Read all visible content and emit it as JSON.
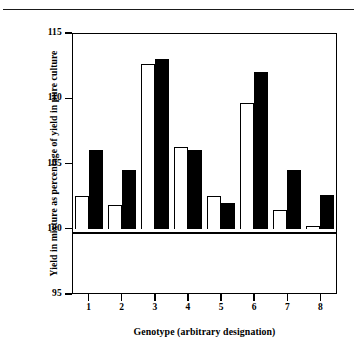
{
  "figure": {
    "has_top_rule": true,
    "background": "#ffffff",
    "ink_color": "#000000"
  },
  "chart_data": {
    "type": "bar",
    "title": "",
    "subtitle": "",
    "xlabel": "Genotype (arbitrary designation)",
    "ylabel": "Yield in mixture as percentage of yield in pure culture",
    "categories": [
      "1",
      "2",
      "3",
      "4",
      "5",
      "6",
      "7",
      "8"
    ],
    "xtick_labels": [
      "1",
      "2",
      "3",
      "4",
      "5",
      "6",
      "7",
      "8"
    ],
    "ytick_labels": [
      "95",
      "100",
      "105",
      "110",
      "115"
    ],
    "yticks": [
      95,
      100,
      105,
      110,
      115
    ],
    "ylim": [
      95,
      115
    ],
    "baseline": 100,
    "grid": false,
    "legend": null,
    "legend_position": "none",
    "series": [
      {
        "name": "open",
        "style": "open-bar",
        "fill": "#ffffff",
        "edge": "#000000",
        "values": [
          102.5,
          101.8,
          112.6,
          106.3,
          102.5,
          109.6,
          101.4,
          100.2
        ]
      },
      {
        "name": "filled",
        "style": "filled-bar",
        "fill": "#000000",
        "edge": "#000000",
        "values": [
          106.0,
          104.5,
          113.0,
          106.0,
          102.0,
          112.0,
          104.5,
          102.6
        ]
      }
    ]
  }
}
